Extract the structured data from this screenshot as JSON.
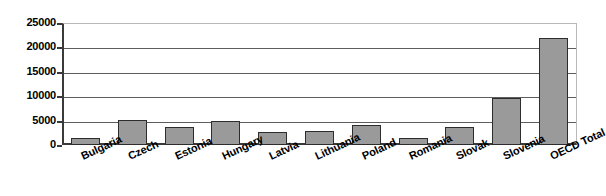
{
  "chart_data": {
    "type": "bar",
    "title": "",
    "subtitle": "",
    "xlabel": "",
    "ylabel": "",
    "ylim": [
      0,
      25000
    ],
    "y_ticks": [
      0,
      5000,
      10000,
      15000,
      20000,
      25000
    ],
    "y_tick_labels": [
      "0",
      "5000",
      "10000",
      "15000",
      "20000",
      "25000"
    ],
    "grid": true,
    "legend": false,
    "legend_position": "none",
    "categories": [
      "Bulgaria",
      "Czech",
      "Estonia",
      "Hungary",
      "Latvia",
      "Lithuania",
      "Poland",
      "Romania",
      "Slovak",
      "Slovenia",
      "OECD Total"
    ],
    "values": [
      1500,
      5100,
      3700,
      4900,
      2600,
      2900,
      4100,
      1400,
      3600,
      9600,
      22000
    ],
    "series": [
      {
        "name": "",
        "values": [
          1500,
          5100,
          3700,
          4900,
          2600,
          2900,
          4100,
          1400,
          3600,
          9600,
          22000
        ]
      }
    ],
    "colors": {
      "bar_fill": "#9a9a9a",
      "bar_border": "#2d2d2d",
      "gridline": "#5d5d5d",
      "axis": "#3a3a3a",
      "background": "#ffffff",
      "text": "#000000"
    }
  }
}
